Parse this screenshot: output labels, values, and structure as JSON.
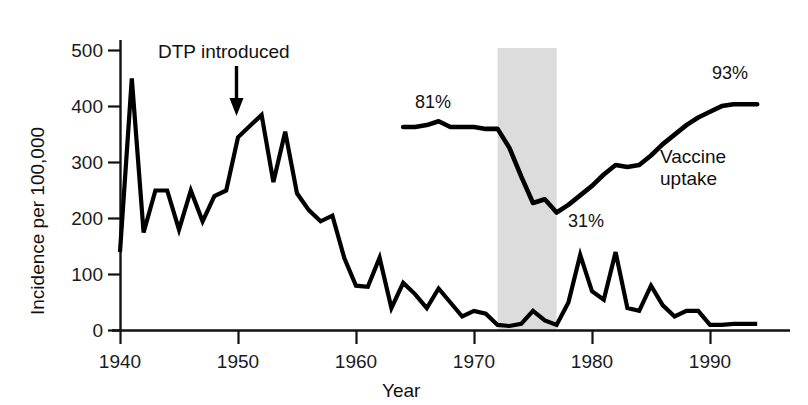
{
  "chart_data": {
    "type": "line",
    "title": "",
    "xlabel": "Year",
    "ylabel": "Incidence per 100,000",
    "xlim": [
      1940,
      1995
    ],
    "ylim": [
      0,
      500
    ],
    "xticks": [
      1940,
      1950,
      1960,
      1970,
      1980,
      1990
    ],
    "yticks": [
      0,
      100,
      200,
      300,
      400,
      500
    ],
    "grid": false,
    "legend_position": "inline-annotation",
    "series": [
      {
        "name": "Incidence per 100,000",
        "axis": "left",
        "x": [
          1940,
          1941,
          1942,
          1943,
          1944,
          1945,
          1946,
          1947,
          1948,
          1949,
          1950,
          1951,
          1952,
          1953,
          1954,
          1955,
          1956,
          1957,
          1958,
          1959,
          1960,
          1961,
          1962,
          1963,
          1964,
          1965,
          1966,
          1967,
          1968,
          1969,
          1970,
          1971,
          1972,
          1973,
          1974,
          1975,
          1976,
          1977,
          1978,
          1979,
          1980,
          1981,
          1982,
          1983,
          1984,
          1985,
          1986,
          1987,
          1988,
          1989,
          1990,
          1991,
          1992,
          1993,
          1994
        ],
        "values": [
          140,
          450,
          175,
          250,
          250,
          180,
          250,
          195,
          240,
          250,
          345,
          365,
          385,
          265,
          355,
          245,
          215,
          195,
          205,
          130,
          80,
          78,
          130,
          40,
          85,
          65,
          40,
          75,
          50,
          25,
          35,
          30,
          10,
          8,
          12,
          35,
          18,
          10,
          50,
          135,
          70,
          55,
          140,
          40,
          35,
          80,
          45,
          25,
          35,
          35,
          10,
          10,
          12,
          12,
          12
        ]
      },
      {
        "name": "Vaccine uptake",
        "axis": "right-implicit",
        "unit": "%",
        "x": [
          1964,
          1965,
          1966,
          1967,
          1968,
          1969,
          1970,
          1971,
          1972,
          1973,
          1974,
          1975,
          1976,
          1977,
          1978,
          1979,
          1980,
          1981,
          1982,
          1983,
          1984,
          1985,
          1986,
          1987,
          1988,
          1989,
          1990,
          1991,
          1992,
          1993,
          1994
        ],
        "values": [
          81,
          81,
          82,
          84,
          81,
          81,
          81,
          80,
          80,
          70,
          55,
          41,
          43,
          36,
          40,
          45,
          50,
          56,
          61,
          60,
          61,
          66,
          72,
          77,
          82,
          86,
          89,
          92,
          93,
          93,
          93
        ]
      }
    ],
    "annotations": [
      {
        "text": "DTP introduced",
        "x": 1950,
        "note": "arrow pointing down to incidence curve at 1950"
      },
      {
        "text": "81%",
        "x": 1967,
        "series": "Vaccine uptake"
      },
      {
        "text": "31%",
        "x": 1977,
        "series": "Vaccine uptake"
      },
      {
        "text": "93%",
        "x": 1991,
        "series": "Vaccine uptake"
      },
      {
        "text": "Vaccine uptake",
        "x": 1986,
        "note": "series label"
      }
    ],
    "shaded_band": {
      "from": 1972,
      "to": 1977,
      "color": "#dcdcdc"
    },
    "colors": {
      "line": "#000000",
      "band": "#dcdcdc",
      "axis": "#111111",
      "background": "#ffffff"
    }
  },
  "axes": {
    "y_title": "Incidence per 100,000",
    "x_title": "Year",
    "y_ticks": [
      "500",
      "400",
      "300",
      "200",
      "100",
      "0"
    ],
    "x_ticks": [
      "1940",
      "1950",
      "1960",
      "1970",
      "1980",
      "1990"
    ]
  },
  "annotations": {
    "dtp": "DTP introduced",
    "pct_start": "81%",
    "pct_low": "31%",
    "pct_end": "93%",
    "series_label_line1": "Vaccine",
    "series_label_line2": "uptake"
  }
}
